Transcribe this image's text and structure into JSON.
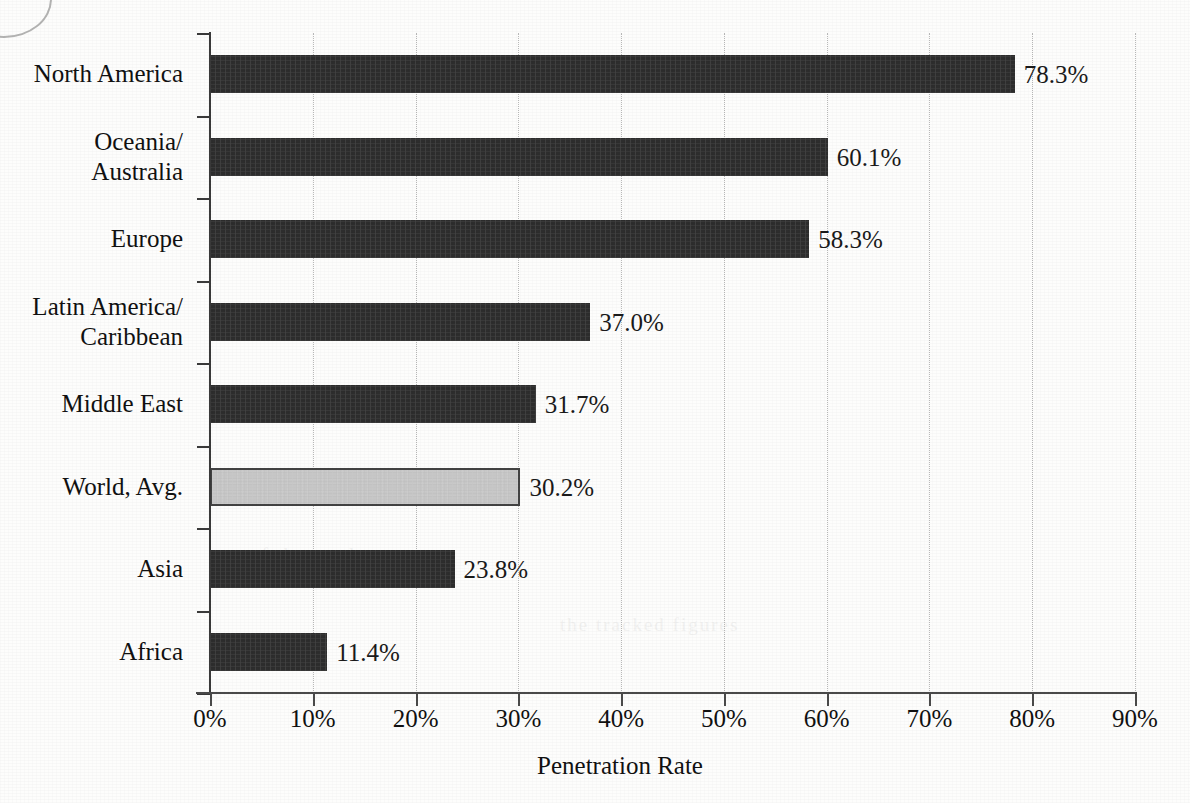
{
  "chart_data": {
    "type": "bar",
    "orientation": "horizontal",
    "title": "",
    "xlabel": "Penetration Rate",
    "ylabel": "",
    "categories": [
      "North America",
      "Oceania/\nAustralia",
      "Europe",
      "Latin America/\nCaribbean",
      "Middle East",
      "World, Avg.",
      "Asia",
      "Africa"
    ],
    "values": [
      78.3,
      60.1,
      58.3,
      37.0,
      31.7,
      30.2,
      23.8,
      11.4
    ],
    "value_labels": [
      "78.3%",
      "60.1%",
      "58.3%",
      "37.0%",
      "31.7%",
      "30.2%",
      "23.8%",
      "11.4%"
    ],
    "highlighted_index": 5,
    "xlim": [
      0,
      90
    ],
    "xticks": [
      0,
      10,
      20,
      30,
      40,
      50,
      60,
      70,
      80,
      90
    ],
    "xtick_labels": [
      "0%",
      "10%",
      "20%",
      "30%",
      "40%",
      "50%",
      "60%",
      "70%",
      "80%",
      "90%"
    ],
    "grid": "vertical-dotted",
    "legend": "none",
    "bar_color": "#2d2d2d",
    "highlight_color": "#c6c6c6",
    "highlight_border_color": "#434343",
    "gridline_color": "#b9b9b9",
    "axis_color": "#3a3a3a",
    "text_color": "#111111"
  },
  "artifacts": {
    "ghost_texts": [
      "the tracked figures",
      "of the total"
    ]
  }
}
